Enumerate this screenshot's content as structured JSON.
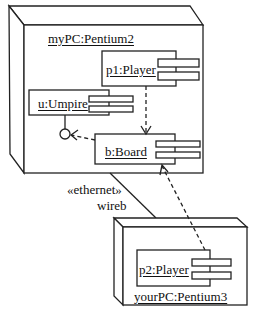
{
  "diagram": {
    "type": "UML deployment diagram",
    "nodes": [
      {
        "id": "node-mypc",
        "label": "myPC:Pentium2",
        "components": [
          {
            "id": "p1",
            "label": "p1:Player"
          },
          {
            "id": "u",
            "label": "u:Umpire"
          },
          {
            "id": "b",
            "label": "b:Board"
          }
        ]
      },
      {
        "id": "node-yourpc",
        "label": "yourPC:Pentium3",
        "components": [
          {
            "id": "p2",
            "label": "p2:Player"
          }
        ]
      }
    ],
    "connection": {
      "stereotype": "«ethernet»",
      "name": "wireb"
    },
    "dependencies": [
      {
        "from": "p1:Player",
        "to": "b:Board"
      },
      {
        "from": "b:Board",
        "to": "u:Umpire interface"
      },
      {
        "from": "p2:Player",
        "to": "b:Board"
      }
    ],
    "colors": {
      "line": "#222222",
      "background": "#ffffff"
    }
  }
}
